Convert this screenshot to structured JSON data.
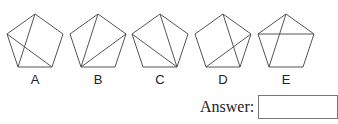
{
  "question": {
    "options": [
      {
        "label": "A",
        "center_x": 35,
        "diagonals": [
          [
            "top",
            "lower_left"
          ],
          [
            "upper_left",
            "lower_right"
          ]
        ]
      },
      {
        "label": "B",
        "center_x": 98,
        "diagonals": [
          [
            "top",
            "lower_left"
          ],
          [
            "upper_right",
            "lower_left"
          ]
        ]
      },
      {
        "label": "C",
        "center_x": 160,
        "diagonals": [
          [
            "top",
            "lower_right"
          ],
          [
            "upper_left",
            "lower_right"
          ]
        ]
      },
      {
        "label": "D",
        "center_x": 223,
        "diagonals": [
          [
            "top",
            "lower_right"
          ],
          [
            "upper_right",
            "lower_left"
          ]
        ]
      },
      {
        "label": "E",
        "center_x": 286,
        "diagonals": [
          [
            "top",
            "lower_left"
          ],
          [
            "upper_left",
            "upper_right"
          ]
        ]
      }
    ],
    "line_color": "#555555"
  },
  "answer": {
    "label": "Answer:",
    "value": ""
  }
}
